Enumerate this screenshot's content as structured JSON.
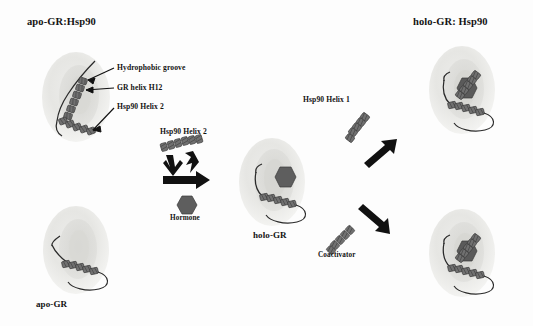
{
  "figure": {
    "domain": "scientific-diagram",
    "background_color": "#fdfdfd",
    "ink_color": "#131313",
    "blob_fill": "#e8e8e6",
    "blob_core": "#d2d2cf",
    "helix_fill": "#6d6d6d",
    "hormone_fill": "#5e5e5e",
    "arrow_fill": "#111111"
  },
  "titles": {
    "apo_gr_hsp90": "apo-GR:Hsp90",
    "holo_gr_hsp90": "holo-GR: Hsp90",
    "apo_gr": "apo-GR",
    "holo_gr": "holo-GR"
  },
  "annotations": {
    "hydrophobic_groove": "Hydrophobic groove",
    "gr_helix_h12": "GR helix H12",
    "hsp90_helix_2": "Hsp90 Helix 2"
  },
  "middle": {
    "hsp90_helix_2": "Hsp90 Helix 2",
    "hormone": "Hormone"
  },
  "right": {
    "hsp90_helix_1": "Hsp90 Helix 1",
    "coactivator": "Coactivator"
  },
  "structures": [
    {
      "id": "apo-gr-hsp90",
      "label": "apo-GR:Hsp90",
      "position": "top-left",
      "hormone_bound": false,
      "hsp90_bound": true
    },
    {
      "id": "apo-gr",
      "label": "apo-GR",
      "position": "bottom-left",
      "hormone_bound": false,
      "hsp90_bound": false
    },
    {
      "id": "holo-gr",
      "label": "holo-GR",
      "position": "center",
      "hormone_bound": true,
      "hsp90_bound": false
    },
    {
      "id": "holo-gr-hsp90-top",
      "label": "holo-GR: Hsp90",
      "position": "top-right",
      "hormone_bound": true,
      "hsp90_bound": true
    },
    {
      "id": "holo-gr-coactivator",
      "label": "",
      "position": "bottom-right",
      "hormone_bound": true,
      "coactivator_bound": true
    }
  ],
  "arrows": [
    {
      "id": "hormone-binding-arrow",
      "direction": "right",
      "from": "apo-GR",
      "to": "holo-GR"
    },
    {
      "id": "hsp90-helix2-arrow",
      "direction": "down",
      "from": "Hsp90 Helix 2",
      "to": "holo-GR"
    },
    {
      "id": "hsp90-helix1-arrow",
      "direction": "up-right",
      "from": "holo-GR",
      "to": "holo-GR: Hsp90"
    },
    {
      "id": "coactivator-arrow",
      "direction": "down-right",
      "from": "holo-GR",
      "to": "holo-GR coactivator complex"
    }
  ]
}
